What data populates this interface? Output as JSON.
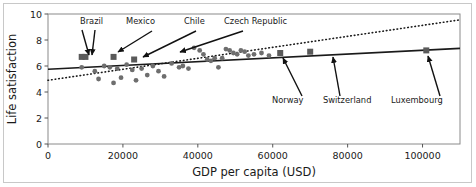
{
  "chart_data": {
    "type": "scatter",
    "title": "",
    "xlabel": "GDP per capita (USD)",
    "ylabel": "Life satisfaction",
    "xlim": [
      0,
      110000
    ],
    "ylim": [
      0,
      10
    ],
    "xticks": [
      0,
      20000,
      40000,
      60000,
      80000,
      100000
    ],
    "xtick_labels": [
      "0",
      "20000",
      "40000",
      "60000",
      "80000",
      "100000"
    ],
    "yticks": [
      0,
      2,
      4,
      6,
      8,
      10
    ],
    "ytick_labels": [
      "0",
      "2",
      "4",
      "6",
      "8",
      "10"
    ],
    "grid": false,
    "legend": "none",
    "marker_color": "#6e6e6e",
    "highlight_color": "#5a5a5a",
    "line_color": "#1a1a1a",
    "series": [
      {
        "name": "countries",
        "marker": "circle",
        "points": [
          {
            "x": 9000,
            "y": 5.9
          },
          {
            "x": 12500,
            "y": 5.6
          },
          {
            "x": 13500,
            "y": 5.0
          },
          {
            "x": 15000,
            "y": 6.0
          },
          {
            "x": 16500,
            "y": 5.9
          },
          {
            "x": 17500,
            "y": 4.7
          },
          {
            "x": 18500,
            "y": 5.8
          },
          {
            "x": 19500,
            "y": 5.1
          },
          {
            "x": 21000,
            "y": 6.1
          },
          {
            "x": 22500,
            "y": 5.7
          },
          {
            "x": 23500,
            "y": 4.9
          },
          {
            "x": 25000,
            "y": 5.8
          },
          {
            "x": 26500,
            "y": 5.3
          },
          {
            "x": 28000,
            "y": 6.0
          },
          {
            "x": 29500,
            "y": 5.6
          },
          {
            "x": 31000,
            "y": 5.2
          },
          {
            "x": 33000,
            "y": 6.2
          },
          {
            "x": 35000,
            "y": 5.9
          },
          {
            "x": 36000,
            "y": 6.0
          },
          {
            "x": 37500,
            "y": 5.8
          },
          {
            "x": 39000,
            "y": 7.4
          },
          {
            "x": 40500,
            "y": 7.2
          },
          {
            "x": 41500,
            "y": 6.9
          },
          {
            "x": 42500,
            "y": 6.5
          },
          {
            "x": 43500,
            "y": 6.4
          },
          {
            "x": 44500,
            "y": 6.6
          },
          {
            "x": 45500,
            "y": 5.9
          },
          {
            "x": 46500,
            "y": 6.6
          },
          {
            "x": 47500,
            "y": 7.3
          },
          {
            "x": 48500,
            "y": 7.2
          },
          {
            "x": 49500,
            "y": 7.0
          },
          {
            "x": 50500,
            "y": 6.9
          },
          {
            "x": 51500,
            "y": 7.2
          },
          {
            "x": 52500,
            "y": 7.1
          },
          {
            "x": 53500,
            "y": 6.8
          },
          {
            "x": 55000,
            "y": 6.9
          },
          {
            "x": 57000,
            "y": 7.0
          },
          {
            "x": 59000,
            "y": 6.8
          }
        ]
      },
      {
        "name": "highlighted-countries",
        "marker": "square",
        "points": [
          {
            "x": 9000,
            "y": 6.7,
            "label": "Brazil"
          },
          {
            "x": 10000,
            "y": 6.7,
            "label": "Mexico"
          },
          {
            "x": 17500,
            "y": 6.7,
            "label": "Chile"
          },
          {
            "x": 23000,
            "y": 6.5,
            "label": "Czech Republic"
          },
          {
            "x": 62000,
            "y": 7.0,
            "label": "Norway"
          },
          {
            "x": 70000,
            "y": 7.1,
            "label": "Switzerland"
          },
          {
            "x": 101000,
            "y": 7.2,
            "label": "Luxembourg"
          }
        ]
      }
    ],
    "fit_lines": [
      {
        "name": "linear-fit",
        "style": "solid",
        "x0": 0,
        "y0": 5.75,
        "x1": 110000,
        "y1": 7.35
      },
      {
        "name": "secondary-fit",
        "style": "dotted",
        "x0": 0,
        "y0": 4.9,
        "x1": 110000,
        "y1": 9.55
      }
    ],
    "annotations": [
      {
        "name": "brazil",
        "label": "Brazil",
        "label_x": 80,
        "label_y": 24,
        "arrows": [
          [
            82,
            30,
            89,
            55
          ],
          [
            95,
            30,
            92,
            55
          ]
        ]
      },
      {
        "name": "mexico",
        "label": "Mexico",
        "label_x": 126,
        "label_y": 24,
        "arrows": [
          [
            152,
            31,
            118,
            52
          ]
        ]
      },
      {
        "name": "chile",
        "label": "Chile",
        "label_x": 184,
        "label_y": 24,
        "arrows": [
          [
            196,
            31,
            143,
            57
          ]
        ]
      },
      {
        "name": "czech-republic",
        "label": "Czech Republic",
        "label_x": 224,
        "label_y": 24,
        "arrows": [
          [
            243,
            31,
            180,
            52
          ]
        ]
      },
      {
        "name": "norway",
        "label": "Norway",
        "label_x": 272,
        "label_y": 103,
        "arrows": [
          [
            302,
            96,
            283,
            58
          ]
        ]
      },
      {
        "name": "switzerland",
        "label": "Switzerland",
        "label_x": 323,
        "label_y": 103,
        "arrows": [
          [
            340,
            96,
            333,
            57
          ]
        ]
      },
      {
        "name": "luxembourg",
        "label": "Luxembourg",
        "label_x": 391,
        "label_y": 103,
        "arrows": [
          [
            440,
            96,
            428,
            56
          ]
        ]
      }
    ]
  }
}
